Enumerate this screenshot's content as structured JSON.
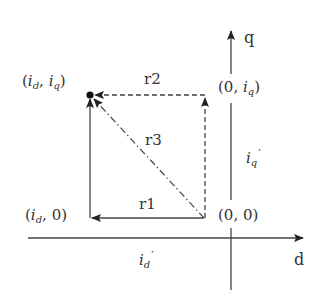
{
  "diagram": {
    "type": "dq-coordinate-vector-diagram",
    "axes": {
      "d": {
        "label": "d"
      },
      "q": {
        "label": "q"
      }
    },
    "points": {
      "target": {
        "open": "(",
        "var1": "i",
        "sub1": "d",
        "sep": ",",
        "var2": "i",
        "sub2": "q",
        "close": ")"
      },
      "on_q": {
        "open": "(",
        "zero": "0",
        "sep": ",",
        "var": "i",
        "sub": "q",
        "close": ")"
      },
      "origin": {
        "text": "(0, 0)"
      },
      "on_d": {
        "open": "(",
        "var": "i",
        "sub": "d",
        "sep": ",",
        "zero": "0",
        "close": ")"
      }
    },
    "paths": {
      "r1": {
        "label": "r1",
        "style": "solid"
      },
      "r2": {
        "label": "r2",
        "style": "dashed"
      },
      "r3": {
        "label": "r3",
        "style": "dash-dot"
      }
    },
    "annotations": {
      "iq_prime": {
        "var": "i",
        "sub": "q",
        "prime": "′"
      },
      "id_prime": {
        "var": "i",
        "sub": "d",
        "prime": "′"
      }
    },
    "colors": {
      "line": "#444444",
      "text": "#333333"
    }
  }
}
